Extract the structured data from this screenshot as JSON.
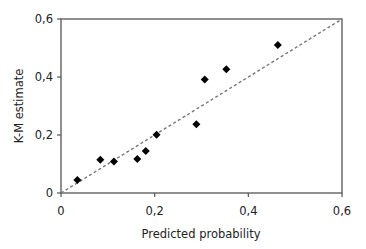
{
  "chart_data": {
    "type": "scatter",
    "title": "",
    "xlabel": "Predicted probability",
    "ylabel": "K-M estimate",
    "xlim": [
      0,
      0.6
    ],
    "ylim": [
      0,
      0.6
    ],
    "xticks": [
      0,
      0.2,
      0.4,
      0.6
    ],
    "yticks": [
      0,
      0.2,
      0.4,
      0.6
    ],
    "xtick_labels": [
      "0",
      "0,2",
      "0,4",
      "0,6"
    ],
    "ytick_labels": [
      "0",
      "0,2",
      "0,4",
      "0,6"
    ],
    "grid": false,
    "legend": null,
    "series": [
      {
        "name": "Observed",
        "marker": "diamond",
        "color": "#000000",
        "points": [
          {
            "x": 0.035,
            "y": 0.045
          },
          {
            "x": 0.084,
            "y": 0.115
          },
          {
            "x": 0.113,
            "y": 0.109
          },
          {
            "x": 0.163,
            "y": 0.117
          },
          {
            "x": 0.181,
            "y": 0.145
          },
          {
            "x": 0.204,
            "y": 0.201
          },
          {
            "x": 0.289,
            "y": 0.237
          },
          {
            "x": 0.307,
            "y": 0.391
          },
          {
            "x": 0.353,
            "y": 0.427
          },
          {
            "x": 0.463,
            "y": 0.51
          }
        ]
      }
    ],
    "reference_line": {
      "name": "Perfect calibration",
      "style": "dashed",
      "color": "#777777",
      "from": [
        0,
        0
      ],
      "to": [
        0.6,
        0.6
      ]
    }
  },
  "colors": {
    "axis": "#555555",
    "marker": "#000000",
    "reference": "#777777"
  }
}
